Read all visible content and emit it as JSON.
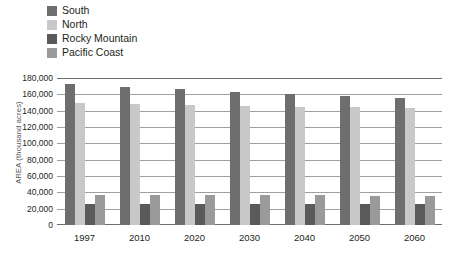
{
  "legend": {
    "position": "top-left",
    "items": [
      {
        "label": "South",
        "color": "#6e6e6e"
      },
      {
        "label": "North",
        "color": "#c8c8c8"
      },
      {
        "label": "Rocky Mountain",
        "color": "#5a5a5a"
      },
      {
        "label": "Pacific Coast",
        "color": "#9a9a9a"
      }
    ]
  },
  "chart_data": {
    "type": "bar",
    "title": "",
    "xlabel": "",
    "ylabel": "AREA (thousand acres)",
    "categories": [
      "1997",
      "2010",
      "2020",
      "2030",
      "2040",
      "2050",
      "2060"
    ],
    "series": [
      {
        "name": "South",
        "color": "#6e6e6e",
        "values": [
          173000,
          169000,
          166000,
          163000,
          160000,
          158000,
          155000
        ]
      },
      {
        "name": "North",
        "color": "#c8c8c8",
        "values": [
          150000,
          148000,
          147000,
          146000,
          145000,
          144000,
          143000
        ]
      },
      {
        "name": "Rocky Mountain",
        "color": "#5a5a5a",
        "values": [
          26000,
          26000,
          26000,
          26000,
          26000,
          26000,
          26000
        ]
      },
      {
        "name": "Pacific Coast",
        "color": "#9a9a9a",
        "values": [
          37000,
          37000,
          37000,
          36500,
          36500,
          36000,
          36000
        ]
      }
    ],
    "ylim": [
      0,
      180000
    ],
    "yticks": [
      "0",
      "20,000",
      "40,000",
      "60,000",
      "80,000",
      "100,000",
      "120,000",
      "140,000",
      "160,000",
      "180,000"
    ],
    "ytick_values": [
      0,
      20000,
      40000,
      60000,
      80000,
      100000,
      120000,
      140000,
      160000,
      180000
    ],
    "grid": true,
    "legend_position": "top-left"
  }
}
